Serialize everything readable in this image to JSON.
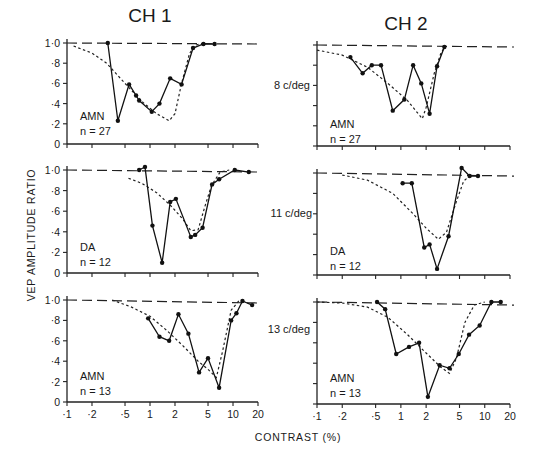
{
  "figure": {
    "column_titles": [
      "CH 1",
      "CH 2"
    ],
    "y_axis_label": "VEP AMPLITUDE RATIO",
    "x_axis_label": "CONTRAST (%)",
    "row_labels": [
      "8 c/deg",
      "11 c/deg",
      "13 c/deg"
    ],
    "y_tick_labels": [
      "0",
      "·2",
      "·4",
      "·6",
      "·8",
      "1·0"
    ],
    "x_tick_labels": [
      "·1",
      "·2",
      "·5",
      "1",
      "2",
      "5",
      "10",
      "20"
    ],
    "x_tick_values": [
      0.1,
      0.2,
      0.5,
      1,
      2,
      5,
      10,
      20
    ]
  },
  "chart_data": [
    {
      "type": "line",
      "panel": "CH1 8 c/deg",
      "group": "AMN",
      "n_label": "n = 27",
      "xscale": "log",
      "xlim": [
        0.1,
        20
      ],
      "ylim": [
        0,
        1.0
      ],
      "series": [
        {
          "name": "data",
          "x": [
            0.31,
            0.41,
            0.56,
            0.68,
            0.74,
            1.05,
            1.3,
            1.75,
            2.4,
            3.3,
            4.4,
            6.0
          ],
          "y": [
            1.0,
            0.23,
            0.59,
            0.48,
            0.43,
            0.32,
            0.4,
            0.65,
            0.59,
            0.95,
            0.99,
            0.99
          ]
        },
        {
          "name": "model fit (dotted)",
          "x": [
            0.12,
            0.2,
            0.3,
            0.5,
            0.8,
            1.2,
            1.7,
            2.0,
            2.4,
            3.0,
            3.6,
            4.5
          ],
          "y": [
            0.97,
            0.9,
            0.8,
            0.6,
            0.42,
            0.3,
            0.23,
            0.3,
            0.6,
            0.9,
            0.98,
            1.0
          ]
        },
        {
          "name": "reference 1.0 (dashed)",
          "x": [
            0.1,
            20
          ],
          "y": [
            1.0,
            0.99
          ]
        }
      ]
    },
    {
      "type": "line",
      "panel": "CH2 8 c/deg",
      "group": "AMN",
      "n_label": "n = 27",
      "xscale": "log",
      "xlim": [
        0.1,
        20
      ],
      "ylim": [
        0,
        1.0
      ],
      "series": [
        {
          "name": "data",
          "x": [
            0.25,
            0.35,
            0.45,
            0.58,
            0.8,
            1.1,
            1.4,
            1.75,
            2.2,
            2.7,
            3.3
          ],
          "y": [
            0.88,
            0.72,
            0.8,
            0.8,
            0.35,
            0.46,
            0.8,
            0.62,
            0.32,
            0.79,
            0.98
          ]
        },
        {
          "name": "model fit (dotted)",
          "x": [
            0.1,
            0.2,
            0.4,
            0.7,
            1.2,
            1.8,
            2.0,
            2.5,
            3.0,
            3.4
          ],
          "y": [
            0.95,
            0.9,
            0.78,
            0.62,
            0.45,
            0.27,
            0.38,
            0.72,
            0.92,
            0.99
          ]
        },
        {
          "name": "reference 1.0 (dashed)",
          "x": [
            0.1,
            20
          ],
          "y": [
            1.0,
            0.98
          ]
        }
      ]
    },
    {
      "type": "line",
      "panel": "CH1 11 c/deg",
      "group": "DA",
      "n_label": "n = 12",
      "xscale": "log",
      "xlim": [
        0.1,
        20
      ],
      "ylim": [
        0,
        1.0
      ],
      "series": [
        {
          "name": "data",
          "x": [
            0.74,
            0.87,
            1.07,
            1.4,
            1.75,
            2.05,
            3.1,
            3.5,
            4.3,
            5.6,
            6.8,
            10.5,
            15.5
          ],
          "y": [
            1.0,
            1.03,
            0.46,
            0.1,
            0.69,
            0.72,
            0.35,
            0.37,
            0.44,
            0.86,
            0.91,
            1.0,
            0.98
          ]
        },
        {
          "name": "model fit (dotted)",
          "x": [
            0.55,
            0.8,
            1.2,
            1.8,
            2.5,
            3.1,
            3.8,
            4.6,
            5.5,
            7.0,
            9.0
          ],
          "y": [
            0.92,
            0.87,
            0.78,
            0.65,
            0.52,
            0.41,
            0.42,
            0.65,
            0.85,
            0.98,
            1.0
          ]
        },
        {
          "name": "reference 1.0 (dashed)",
          "x": [
            0.1,
            20
          ],
          "y": [
            1.0,
            0.98
          ]
        }
      ]
    },
    {
      "type": "line",
      "panel": "CH2 11 c/deg",
      "group": "DA",
      "n_label": "n = 12",
      "xscale": "log",
      "xlim": [
        0.1,
        20
      ],
      "ylim": [
        0,
        1.0
      ],
      "series": [
        {
          "name": "data",
          "x": [
            1.05,
            1.35,
            1.9,
            2.2,
            2.7,
            3.7,
            5.3,
            6.6,
            8.3
          ],
          "y": [
            0.9,
            0.9,
            0.27,
            0.3,
            0.06,
            0.38,
            1.05,
            0.97,
            0.97
          ]
        },
        {
          "name": "model fit (dotted)",
          "x": [
            0.2,
            0.4,
            0.8,
            1.4,
            2.0,
            2.8,
            3.5,
            4.5,
            5.6,
            7.0
          ],
          "y": [
            0.98,
            0.93,
            0.8,
            0.6,
            0.46,
            0.35,
            0.42,
            0.7,
            0.92,
            0.99
          ]
        },
        {
          "name": "reference 1.0 (dashed)",
          "x": [
            0.1,
            20
          ],
          "y": [
            1.0,
            0.97
          ]
        }
      ]
    },
    {
      "type": "line",
      "panel": "CH1 13 c/deg",
      "group": "AMN",
      "n_label": "n = 13",
      "xscale": "log",
      "xlim": [
        0.1,
        20
      ],
      "ylim": [
        0,
        1.0
      ],
      "series": [
        {
          "name": "data",
          "x": [
            0.95,
            1.3,
            1.7,
            2.2,
            2.9,
            3.9,
            5.0,
            6.8,
            9.5,
            11.0,
            13.0,
            17.0
          ],
          "y": [
            0.82,
            0.64,
            0.6,
            0.86,
            0.67,
            0.29,
            0.43,
            0.14,
            0.8,
            0.87,
            0.99,
            0.95
          ]
        },
        {
          "name": "model fit (dotted)",
          "x": [
            0.35,
            0.6,
            1.0,
            1.6,
            2.5,
            3.8,
            5.0,
            6.3,
            7.5,
            9.5,
            12.0
          ],
          "y": [
            1.0,
            0.93,
            0.84,
            0.7,
            0.55,
            0.4,
            0.32,
            0.24,
            0.5,
            0.9,
            1.0
          ]
        },
        {
          "name": "reference 1.0 (dashed)",
          "x": [
            0.1,
            20
          ],
          "y": [
            1.0,
            0.97
          ]
        }
      ]
    },
    {
      "type": "line",
      "panel": "CH2 13 c/deg",
      "group": "AMN",
      "n_label": "n = 13",
      "xscale": "log",
      "xlim": [
        0.1,
        20
      ],
      "ylim": [
        0,
        1.0
      ],
      "series": [
        {
          "name": "data",
          "x": [
            0.52,
            0.65,
            0.88,
            1.25,
            1.65,
            2.1,
            2.9,
            3.8,
            4.9,
            6.5,
            8.7,
            12.0,
            15.5
          ],
          "y": [
            1.0,
            0.93,
            0.49,
            0.56,
            0.6,
            0.07,
            0.38,
            0.35,
            0.49,
            0.68,
            0.77,
            1.0,
            1.0
          ]
        },
        {
          "name": "model fit (dotted)",
          "x": [
            0.1,
            0.2,
            0.4,
            0.7,
            1.2,
            2.0,
            3.0,
            3.8,
            4.6,
            5.8,
            7.5,
            10.0
          ],
          "y": [
            1.0,
            0.99,
            0.95,
            0.85,
            0.68,
            0.5,
            0.36,
            0.3,
            0.45,
            0.8,
            0.97,
            1.0
          ]
        },
        {
          "name": "reference 1.0 (dashed)",
          "x": [
            0.1,
            20
          ],
          "y": [
            1.0,
            0.97
          ]
        }
      ]
    }
  ]
}
